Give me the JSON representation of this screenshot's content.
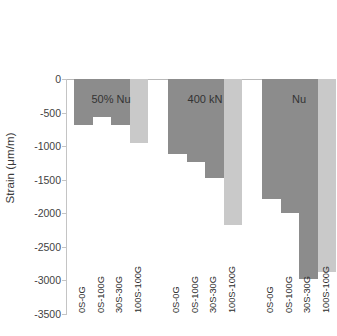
{
  "chart_data": {
    "type": "bar",
    "title": "",
    "xlabel": "",
    "ylabel": "Strain (μm/m)",
    "ylim": [
      -3500,
      0
    ],
    "ytick_step": 500,
    "ytick_labels": [
      "0",
      "-500",
      "-1000",
      "-1500",
      "-2000",
      "-2500",
      "-3000",
      "-3500"
    ],
    "ytick_values": [
      0,
      -500,
      -1000,
      -1500,
      -2000,
      -2500,
      -3000,
      -3500
    ],
    "grid": false,
    "legend": false,
    "categories": [
      "0S-0G",
      "0S-100G",
      "30S-30G",
      "100S-100G"
    ],
    "groups": [
      {
        "label": "50% Nu",
        "categories": [
          "0S-0G",
          "0S-100G",
          "30S-30G",
          "100S-100G"
        ],
        "values": [
          -680,
          -560,
          -680,
          -960
        ],
        "colors": [
          "#8c8c8c",
          "#8c8c8c",
          "#8c8c8c",
          "#c9c9c9"
        ]
      },
      {
        "label": "400 kN",
        "categories": [
          "0S-0G",
          "0S-100G",
          "30S-30G",
          "100S-100G"
        ],
        "values": [
          -1110,
          -1230,
          -1470,
          -2170
        ],
        "colors": [
          "#8c8c8c",
          "#8c8c8c",
          "#8c8c8c",
          "#c9c9c9"
        ]
      },
      {
        "label": "Nu",
        "categories": [
          "0S-0G",
          "0S-100G",
          "30S-30G",
          "100S-100G"
        ],
        "values": [
          -1790,
          -2000,
          -2975,
          -2870
        ],
        "colors": [
          "#8c8c8c",
          "#8c8c8c",
          "#8c8c8c",
          "#c9c9c9"
        ]
      }
    ],
    "bar_color_dark": "#8c8c8c",
    "bar_color_light": "#c9c9c9",
    "axis_color": "#c4c4c4",
    "text_color": "#333333"
  }
}
